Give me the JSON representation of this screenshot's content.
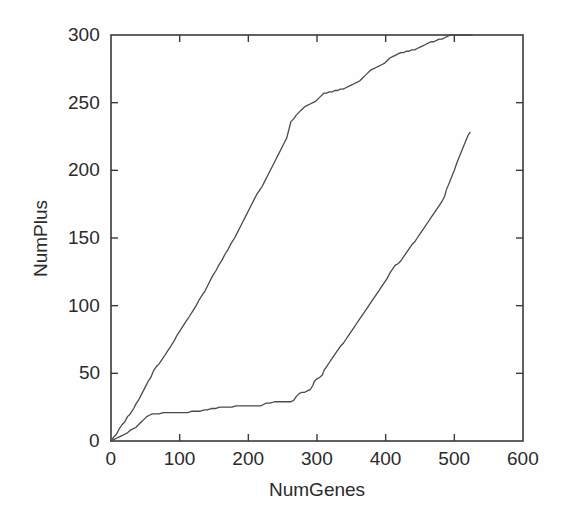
{
  "figure": {
    "background_color": "#fefefe",
    "axis_color": "#3a3a3a",
    "line_color": "#4a4a4a"
  },
  "chart_data": {
    "type": "line",
    "title": "",
    "subtitle": "",
    "xlabel": "NumGenes",
    "ylabel": "NumPlus",
    "xlim": [
      0,
      600
    ],
    "ylim": [
      0,
      300
    ],
    "xticks": [
      0,
      100,
      200,
      300,
      400,
      500,
      600
    ],
    "yticks": [
      0,
      50,
      100,
      150,
      200,
      250,
      300
    ],
    "xtick_labels": [
      "0",
      "100",
      "200",
      "300",
      "400",
      "500",
      "600"
    ],
    "ytick_labels": [
      "0",
      "50",
      "100",
      "150",
      "200",
      "250",
      "300"
    ],
    "grid": false,
    "legend": null,
    "legend_position": "none",
    "annotations": [],
    "series": [
      {
        "name": "upper-curve",
        "color": "#4a4a4a",
        "points": [
          [
            0,
            0
          ],
          [
            4,
            3
          ],
          [
            8,
            5
          ],
          [
            12,
            9
          ],
          [
            16,
            12
          ],
          [
            20,
            14
          ],
          [
            24,
            18
          ],
          [
            28,
            20
          ],
          [
            33,
            24
          ],
          [
            37,
            28
          ],
          [
            41,
            31
          ],
          [
            45,
            35
          ],
          [
            50,
            40
          ],
          [
            54,
            44
          ],
          [
            58,
            47
          ],
          [
            62,
            52
          ],
          [
            66,
            55
          ],
          [
            70,
            57
          ],
          [
            74,
            60
          ],
          [
            78,
            63
          ],
          [
            83,
            67
          ],
          [
            87,
            70
          ],
          [
            92,
            74
          ],
          [
            96,
            78
          ],
          [
            100,
            81
          ],
          [
            105,
            85
          ],
          [
            110,
            89
          ],
          [
            114,
            92
          ],
          [
            119,
            96
          ],
          [
            124,
            100
          ],
          [
            128,
            104
          ],
          [
            133,
            108
          ],
          [
            137,
            111
          ],
          [
            140,
            114
          ],
          [
            144,
            118
          ],
          [
            148,
            122
          ],
          [
            153,
            126
          ],
          [
            157,
            130
          ],
          [
            162,
            134
          ],
          [
            166,
            138
          ],
          [
            171,
            142
          ],
          [
            175,
            146
          ],
          [
            180,
            150
          ],
          [
            184,
            154
          ],
          [
            188,
            158
          ],
          [
            192,
            162
          ],
          [
            196,
            166
          ],
          [
            200,
            170
          ],
          [
            204,
            174
          ],
          [
            208,
            178
          ],
          [
            212,
            182
          ],
          [
            216,
            185
          ],
          [
            220,
            188
          ],
          [
            224,
            192
          ],
          [
            228,
            196
          ],
          [
            232,
            200
          ],
          [
            236,
            204
          ],
          [
            240,
            208
          ],
          [
            244,
            212
          ],
          [
            248,
            216
          ],
          [
            252,
            220
          ],
          [
            256,
            224
          ],
          [
            258,
            228
          ],
          [
            260,
            232
          ],
          [
            262,
            236
          ],
          [
            266,
            238
          ],
          [
            270,
            241
          ],
          [
            274,
            243
          ],
          [
            278,
            245
          ],
          [
            282,
            247
          ],
          [
            286,
            248
          ],
          [
            290,
            249
          ],
          [
            294,
            250
          ],
          [
            298,
            251
          ],
          [
            302,
            253
          ],
          [
            306,
            255
          ],
          [
            310,
            257
          ],
          [
            314,
            257
          ],
          [
            318,
            258
          ],
          [
            322,
            258
          ],
          [
            326,
            259
          ],
          [
            330,
            259
          ],
          [
            334,
            260
          ],
          [
            338,
            260
          ],
          [
            342,
            261
          ],
          [
            346,
            262
          ],
          [
            350,
            263
          ],
          [
            354,
            264
          ],
          [
            358,
            265
          ],
          [
            362,
            266
          ],
          [
            366,
            268
          ],
          [
            370,
            270
          ],
          [
            374,
            272
          ],
          [
            378,
            274
          ],
          [
            382,
            275
          ],
          [
            386,
            276
          ],
          [
            390,
            277
          ],
          [
            394,
            278
          ],
          [
            398,
            279
          ],
          [
            402,
            281
          ],
          [
            406,
            283
          ],
          [
            410,
            284
          ],
          [
            414,
            285
          ],
          [
            418,
            286
          ],
          [
            422,
            287
          ],
          [
            426,
            287
          ],
          [
            430,
            288
          ],
          [
            434,
            288
          ],
          [
            438,
            289
          ],
          [
            442,
            289
          ],
          [
            446,
            290
          ],
          [
            450,
            291
          ],
          [
            454,
            292
          ],
          [
            458,
            293
          ],
          [
            462,
            294
          ],
          [
            466,
            295
          ],
          [
            470,
            295
          ],
          [
            474,
            296
          ],
          [
            478,
            297
          ],
          [
            482,
            297
          ],
          [
            486,
            298
          ],
          [
            490,
            299
          ],
          [
            494,
            300
          ],
          [
            500,
            300
          ],
          [
            510,
            300
          ],
          [
            520,
            300
          ],
          [
            526,
            300
          ]
        ]
      },
      {
        "name": "lower-curve",
        "color": "#4a4a4a",
        "points": [
          [
            0,
            0
          ],
          [
            4,
            1
          ],
          [
            8,
            2
          ],
          [
            12,
            3
          ],
          [
            16,
            4
          ],
          [
            20,
            5
          ],
          [
            24,
            6
          ],
          [
            28,
            8
          ],
          [
            32,
            9
          ],
          [
            36,
            10
          ],
          [
            40,
            12
          ],
          [
            44,
            14
          ],
          [
            48,
            16
          ],
          [
            52,
            18
          ],
          [
            56,
            19
          ],
          [
            60,
            20
          ],
          [
            64,
            20
          ],
          [
            70,
            20
          ],
          [
            76,
            21
          ],
          [
            82,
            21
          ],
          [
            88,
            21
          ],
          [
            94,
            21
          ],
          [
            100,
            21
          ],
          [
            106,
            21
          ],
          [
            112,
            21
          ],
          [
            118,
            22
          ],
          [
            124,
            22
          ],
          [
            130,
            22
          ],
          [
            136,
            23
          ],
          [
            140,
            23
          ],
          [
            146,
            24
          ],
          [
            152,
            24
          ],
          [
            158,
            25
          ],
          [
            164,
            25
          ],
          [
            170,
            25
          ],
          [
            176,
            25
          ],
          [
            182,
            26
          ],
          [
            188,
            26
          ],
          [
            194,
            26
          ],
          [
            200,
            26
          ],
          [
            206,
            26
          ],
          [
            212,
            26
          ],
          [
            218,
            26
          ],
          [
            222,
            27
          ],
          [
            226,
            28
          ],
          [
            232,
            28
          ],
          [
            238,
            29
          ],
          [
            244,
            29
          ],
          [
            250,
            29
          ],
          [
            256,
            29
          ],
          [
            262,
            29
          ],
          [
            266,
            30
          ],
          [
            270,
            33
          ],
          [
            274,
            35
          ],
          [
            278,
            36
          ],
          [
            282,
            36
          ],
          [
            286,
            37
          ],
          [
            290,
            38
          ],
          [
            294,
            41
          ],
          [
            296,
            44
          ],
          [
            300,
            46
          ],
          [
            304,
            47
          ],
          [
            308,
            49
          ],
          [
            310,
            52
          ],
          [
            314,
            55
          ],
          [
            318,
            58
          ],
          [
            322,
            61
          ],
          [
            326,
            64
          ],
          [
            330,
            67
          ],
          [
            334,
            70
          ],
          [
            338,
            72
          ],
          [
            342,
            75
          ],
          [
            346,
            78
          ],
          [
            350,
            81
          ],
          [
            354,
            84
          ],
          [
            358,
            87
          ],
          [
            362,
            90
          ],
          [
            366,
            93
          ],
          [
            370,
            96
          ],
          [
            374,
            99
          ],
          [
            378,
            102
          ],
          [
            382,
            105
          ],
          [
            386,
            108
          ],
          [
            390,
            111
          ],
          [
            394,
            114
          ],
          [
            398,
            117
          ],
          [
            402,
            120
          ],
          [
            406,
            124
          ],
          [
            410,
            127
          ],
          [
            414,
            130
          ],
          [
            418,
            131
          ],
          [
            422,
            133
          ],
          [
            426,
            136
          ],
          [
            430,
            139
          ],
          [
            434,
            142
          ],
          [
            438,
            145
          ],
          [
            442,
            147
          ],
          [
            446,
            150
          ],
          [
            450,
            153
          ],
          [
            454,
            156
          ],
          [
            458,
            159
          ],
          [
            462,
            162
          ],
          [
            466,
            165
          ],
          [
            470,
            168
          ],
          [
            474,
            171
          ],
          [
            478,
            174
          ],
          [
            482,
            177
          ],
          [
            486,
            181
          ],
          [
            488,
            185
          ],
          [
            492,
            190
          ],
          [
            496,
            195
          ],
          [
            500,
            200
          ],
          [
            504,
            206
          ],
          [
            508,
            211
          ],
          [
            512,
            216
          ],
          [
            516,
            221
          ],
          [
            520,
            226
          ],
          [
            523,
            228
          ]
        ]
      }
    ]
  }
}
